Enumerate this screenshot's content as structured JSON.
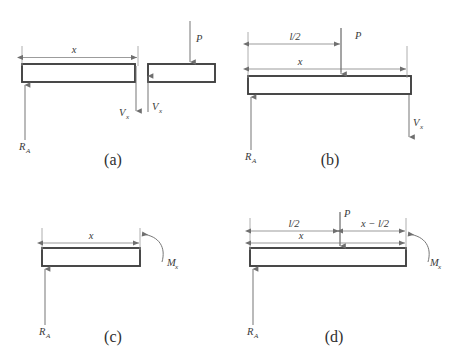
{
  "figure": {
    "panels": [
      {
        "key": "a",
        "caption": "(a)",
        "description": "Left segment cut at distance x with shear Vx, and right segment with load P and shear Vx",
        "labels": {
          "x": "x",
          "P": "P",
          "V_left": "V",
          "V_left_sub": "x",
          "V_right": "V",
          "V_right_sub": "x",
          "R": "R",
          "R_sub": "A"
        }
      },
      {
        "key": "b",
        "caption": "(b)",
        "description": "Segment of length x past midspan, showing l/2 dimension, load P, reaction RA and shear Vx",
        "labels": {
          "half_length": "l/2",
          "x": "x",
          "P": "P",
          "V": "V",
          "V_sub": "x",
          "R": "R",
          "R_sub": "A"
        }
      },
      {
        "key": "c",
        "caption": "(c)",
        "description": "Left segment of length x with reaction RA and internal bending moment Mx",
        "labels": {
          "x": "x",
          "M": "M",
          "M_sub": "x",
          "R": "R",
          "R_sub": "A"
        }
      },
      {
        "key": "d",
        "caption": "(d)",
        "description": "Segment of length x past midspan with dimensions l/2 and x - l/2, load P, reaction RA and bending moment Mx",
        "labels": {
          "half_length": "l/2",
          "x": "x",
          "x_minus_half": "x − l/2",
          "P": "P",
          "M": "M",
          "M_sub": "x",
          "R": "R",
          "R_sub": "A"
        }
      }
    ]
  },
  "colors": {
    "beam_stroke": "#404040",
    "beam_fill": "#ffffff",
    "dimension_line": "#8a8a8a",
    "force_line": "#6f6f6f",
    "text": "#3a3a3a",
    "background": "#ffffff"
  }
}
